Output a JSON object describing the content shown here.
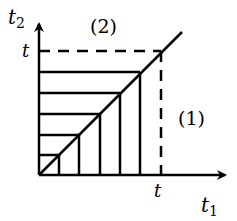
{
  "diagram": {
    "axes": {
      "x_label": "t",
      "x_label_sub": "1",
      "y_label": "t",
      "y_label_sub": "2",
      "x_tick_label": "t",
      "y_tick_label": "t"
    },
    "regions": {
      "upper": "(2)",
      "lower": "(1)"
    },
    "strip_count": 5,
    "colors": {
      "stroke": "#000000",
      "background": "#ffffff"
    }
  }
}
